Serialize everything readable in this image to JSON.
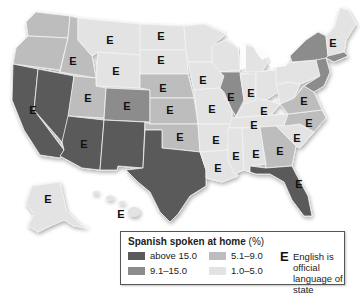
{
  "legend": {
    "title": "Spanish spoken at home",
    "title_unit": "(%)",
    "categories": [
      {
        "label": "above 15.0",
        "color": "#5a5a5a"
      },
      {
        "label": "9.1–15.0",
        "color": "#8c8c8c"
      },
      {
        "label": "5.1–9.0",
        "color": "#bdbdbd"
      },
      {
        "label": "1.0–5.0",
        "color": "#e3e3e3"
      }
    ],
    "official_symbol": "E",
    "official_text_line1": "English is official",
    "official_text_line2": "language of state"
  },
  "colors": {
    "above15": "#5a5a5a",
    "mid9to15": "#8c8c8c",
    "mid5to9": "#bdbdbd",
    "low1to5": "#e3e3e3",
    "border": "#f4f4f4"
  },
  "states": [
    {
      "name": "Washington",
      "category": "5.1–9.0",
      "english_official": false
    },
    {
      "name": "Oregon",
      "category": "5.1–9.0",
      "english_official": false
    },
    {
      "name": "California",
      "category": "above 15.0",
      "english_official": true
    },
    {
      "name": "Nevada",
      "category": "above 15.0",
      "english_official": false
    },
    {
      "name": "Idaho",
      "category": "5.1–9.0",
      "english_official": true
    },
    {
      "name": "Montana",
      "category": "1.0–5.0",
      "english_official": true
    },
    {
      "name": "Wyoming",
      "category": "1.0–5.0",
      "english_official": true
    },
    {
      "name": "Utah",
      "category": "5.1–9.0",
      "english_official": true
    },
    {
      "name": "Colorado",
      "category": "9.1–15.0",
      "english_official": true
    },
    {
      "name": "Arizona",
      "category": "above 15.0",
      "english_official": true
    },
    {
      "name": "New Mexico",
      "category": "above 15.0",
      "english_official": false
    },
    {
      "name": "North Dakota",
      "category": "1.0–5.0",
      "english_official": true
    },
    {
      "name": "South Dakota",
      "category": "1.0–5.0",
      "english_official": true
    },
    {
      "name": "Nebraska",
      "category": "5.1–9.0",
      "english_official": true
    },
    {
      "name": "Kansas",
      "category": "5.1–9.0",
      "english_official": true
    },
    {
      "name": "Oklahoma",
      "category": "5.1–9.0",
      "english_official": true
    },
    {
      "name": "Texas",
      "category": "above 15.0",
      "english_official": false
    },
    {
      "name": "Minnesota",
      "category": "1.0–5.0",
      "english_official": false
    },
    {
      "name": "Iowa",
      "category": "1.0–5.0",
      "english_official": true
    },
    {
      "name": "Missouri",
      "category": "1.0–5.0",
      "english_official": true
    },
    {
      "name": "Arkansas",
      "category": "1.0–5.0",
      "english_official": true
    },
    {
      "name": "Louisiana",
      "category": "1.0–5.0",
      "english_official": true
    },
    {
      "name": "Wisconsin",
      "category": "1.0–5.0",
      "english_official": false
    },
    {
      "name": "Illinois",
      "category": "9.1–15.0",
      "english_official": true
    },
    {
      "name": "Michigan",
      "category": "1.0–5.0",
      "english_official": false
    },
    {
      "name": "Indiana",
      "category": "1.0–5.0",
      "english_official": true
    },
    {
      "name": "Ohio",
      "category": "1.0–5.0",
      "english_official": false
    },
    {
      "name": "Kentucky",
      "category": "1.0–5.0",
      "english_official": true
    },
    {
      "name": "Tennessee",
      "category": "1.0–5.0",
      "english_official": true
    },
    {
      "name": "Mississippi",
      "category": "1.0–5.0",
      "english_official": true
    },
    {
      "name": "Alabama",
      "category": "1.0–5.0",
      "english_official": true
    },
    {
      "name": "Georgia",
      "category": "5.1–9.0",
      "english_official": true
    },
    {
      "name": "Florida",
      "category": "above 15.0",
      "english_official": true
    },
    {
      "name": "South Carolina",
      "category": "1.0–5.0",
      "english_official": true
    },
    {
      "name": "North Carolina",
      "category": "5.1–9.0",
      "english_official": true
    },
    {
      "name": "Virginia",
      "category": "5.1–9.0",
      "english_official": true
    },
    {
      "name": "West Virginia",
      "category": "1.0–5.0",
      "english_official": false
    },
    {
      "name": "Pennsylvania",
      "category": "1.0–5.0",
      "english_official": false
    },
    {
      "name": "New York",
      "category": "9.1–15.0",
      "english_official": false
    },
    {
      "name": "New Jersey",
      "category": "9.1–15.0",
      "english_official": false
    },
    {
      "name": "New England",
      "category": "1.0–5.0",
      "english_official": true
    },
    {
      "name": "Alaska",
      "category": "1.0–5.0",
      "english_official": true
    },
    {
      "name": "Hawaii",
      "category": "1.0–5.0",
      "english_official": true
    }
  ],
  "labels": {
    "e": "E"
  }
}
